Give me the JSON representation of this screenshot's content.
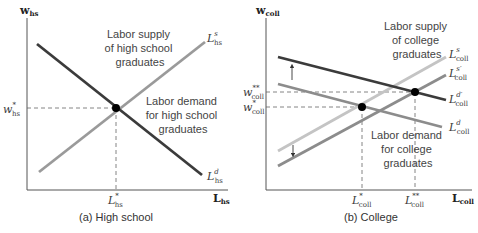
{
  "colors": {
    "axis": "#555555",
    "dark_line": "#3b3b3b",
    "medium_line": "#8c8c8c",
    "light_line": "#c2c2c2",
    "dash": "#666666",
    "point": "#000000"
  },
  "panel_a": {
    "caption": "(a) High school",
    "y_axis": {
      "base": "w",
      "sub": "hs"
    },
    "x_axis": {
      "base": "L",
      "sub": "hs"
    },
    "supply_annotation": [
      "Labor supply",
      "of high school",
      "graduates"
    ],
    "demand_annotation": [
      "Labor demand",
      "for high school",
      "graduates"
    ],
    "supply_label": {
      "base": "L",
      "sup": "s",
      "sub": "hs"
    },
    "demand_label": {
      "base": "L",
      "sup": "d",
      "sub": "hs"
    },
    "w_star": {
      "base": "w",
      "sup": "*",
      "sub": "hs"
    },
    "l_star": {
      "base": "L",
      "sup": "*",
      "sub": "hs"
    }
  },
  "panel_b": {
    "caption": "(b) College",
    "y_axis": {
      "base": "w",
      "sub": "coll"
    },
    "x_axis": {
      "base": "L",
      "sub": "coll"
    },
    "supply_annotation": [
      "Labor supply",
      "of college",
      "graduates"
    ],
    "demand_annotation": [
      "Labor demand",
      "for college",
      "graduates"
    ],
    "supply_label": {
      "base": "L",
      "sup": "s",
      "sub": "coll"
    },
    "supply_shifted_label": {
      "base": "L",
      "sup": "s′",
      "sub": "coll"
    },
    "demand_shifted_label": {
      "base": "L",
      "sup": "d′",
      "sub": "coll"
    },
    "demand_label": {
      "base": "L",
      "sup": "d",
      "sub": "coll"
    },
    "w_star": {
      "base": "w",
      "sup": "*",
      "sub": "coll"
    },
    "w_star2": {
      "base": "w",
      "sup": "**",
      "sub": "coll"
    },
    "l_star": {
      "base": "L",
      "sup": "*",
      "sub": "coll"
    },
    "l_star2": {
      "base": "L",
      "sup": "**",
      "sub": "coll"
    }
  }
}
